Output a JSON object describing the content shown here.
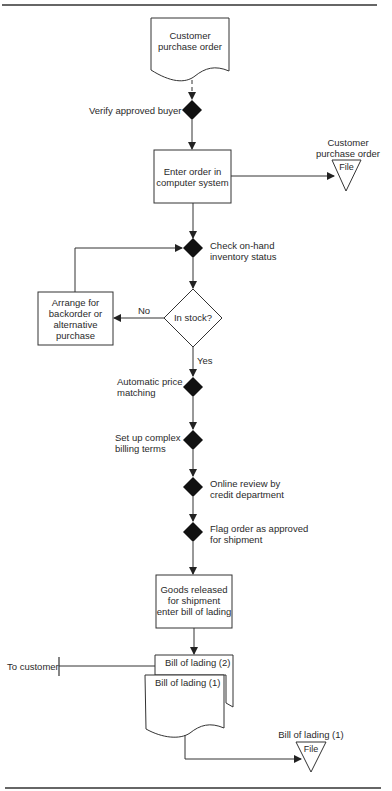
{
  "diagram": {
    "type": "flowchart",
    "nodes": {
      "start_doc": {
        "label_1": "Customer",
        "label_2": "purchase order"
      },
      "verify": {
        "label": "Verify approved buyer"
      },
      "enter_order": {
        "label_1": "Enter order in",
        "label_2": "computer system"
      },
      "file_po": {
        "label_1": "Customer",
        "label_2": "purchase order",
        "file": "File"
      },
      "check_inventory": {
        "label_1": "Check on-hand",
        "label_2": "inventory status"
      },
      "in_stock": {
        "label": "In stock?"
      },
      "backorder": {
        "label_1": "Arrange for",
        "label_2": "backorder or",
        "label_3": "alternative",
        "label_4": "purchase"
      },
      "price_matching": {
        "label_1": "Automatic price",
        "label_2": "matching"
      },
      "billing_terms": {
        "label_1": "Set up complex",
        "label_2": "billing terms"
      },
      "credit_review": {
        "label_1": "Online review by",
        "label_2": "credit department"
      },
      "flag_order": {
        "label_1": "Flag order as approved",
        "label_2": "for shipment"
      },
      "goods_released": {
        "label_1": "Goods released",
        "label_2": "for shipment",
        "label_3": "enter bill of lading"
      },
      "bill_2": {
        "label": "Bill of lading (2)"
      },
      "bill_1": {
        "label": "Bill of lading (1)"
      },
      "to_customer": {
        "label": "To customer"
      },
      "file_bill": {
        "label": "Bill of lading (1)",
        "file": "File"
      }
    },
    "edges": {
      "no": "No",
      "yes": "Yes"
    }
  }
}
